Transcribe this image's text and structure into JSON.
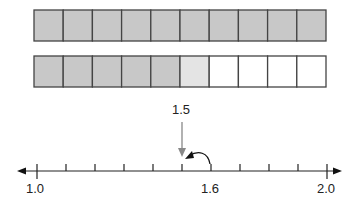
{
  "diagram": {
    "type": "decimal_model_and_number_line",
    "rows": [
      {
        "name": "whole",
        "total_cells": 10,
        "shaded_dark": 10,
        "shaded_light": 0
      },
      {
        "name": "partial",
        "total_cells": 10,
        "shaded_dark": 5,
        "shaded_light": 1
      }
    ],
    "colors": {
      "dark_fill": "#c8c8c8",
      "light_fill": "#e4e4e4",
      "border": "#444444",
      "arrow_pointer": "#888888",
      "line": "#222222"
    },
    "number_line": {
      "start": 1.0,
      "end": 2.0,
      "step": 0.1,
      "labels": [
        "1.0",
        "1.6",
        "2.0"
      ],
      "pointer_label": "1.5",
      "pointer_value": 1.5,
      "curved_arrow": {
        "from": 1.6,
        "to": 1.5
      }
    }
  }
}
